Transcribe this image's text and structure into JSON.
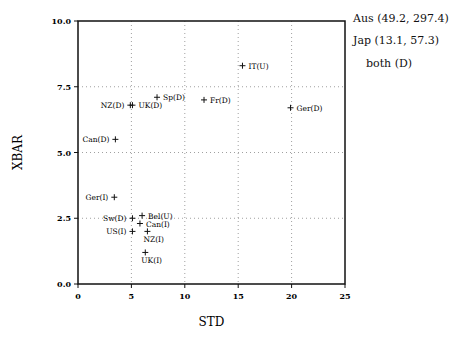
{
  "chart_data": {
    "type": "scatter",
    "title": "",
    "xlabel": "STD",
    "ylabel": "XBAR",
    "xlim": [
      0,
      25
    ],
    "ylim": [
      0.0,
      10.0
    ],
    "xticks": [
      "0",
      "5",
      "10",
      "15",
      "20",
      "25"
    ],
    "yticks": [
      "0.0",
      "2.5",
      "5.0",
      "7.5",
      "10.0"
    ],
    "grid": "dotted at major ticks",
    "legend": "none",
    "points": [
      {
        "label": "IT(U)",
        "x": 15.4,
        "y": 8.3,
        "label_side": "right"
      },
      {
        "label": "Sp(D)",
        "x": 7.4,
        "y": 7.1,
        "label_side": "right"
      },
      {
        "label": "Fr(D)",
        "x": 11.8,
        "y": 7.0,
        "label_side": "right"
      },
      {
        "label": "NZ(D)",
        "x": 4.9,
        "y": 6.8,
        "label_side": "left"
      },
      {
        "label": "UK(D)",
        "x": 5.1,
        "y": 6.8,
        "label_side": "right"
      },
      {
        "label": "Ger(D)",
        "x": 19.9,
        "y": 6.7,
        "label_side": "right"
      },
      {
        "label": "Can(D)",
        "x": 3.5,
        "y": 5.5,
        "label_side": "left"
      },
      {
        "label": "Ger(I)",
        "x": 3.4,
        "y": 3.3,
        "label_side": "left"
      },
      {
        "label": "Sw(D)",
        "x": 5.1,
        "y": 2.5,
        "label_side": "left"
      },
      {
        "label": "Bel(U)",
        "x": 6.0,
        "y": 2.6,
        "label_side": "right"
      },
      {
        "label": "Can(I)",
        "x": 5.8,
        "y": 2.3,
        "label_side": "right"
      },
      {
        "label": "US(I)",
        "x": 5.1,
        "y": 2.0,
        "label_side": "left"
      },
      {
        "label": "NZ(I)",
        "x": 6.5,
        "y": 2.0,
        "label_side": "below"
      },
      {
        "label": "UK(I)",
        "x": 6.3,
        "y": 1.2,
        "label_side": "below"
      }
    ],
    "annotations": [
      "Aus (49.2, 297.4)",
      "Jap (13.1, 57.3)",
      "both (D)"
    ]
  },
  "side_notes": {
    "line1": "Aus (49.2, 297.4)",
    "line2": "Jap (13.1, 57.3)",
    "line3": "both (D)"
  }
}
